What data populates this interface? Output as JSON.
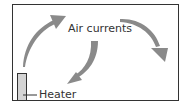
{
  "diagram": {
    "room_label": "Air currents",
    "heater_label": "Heater",
    "colors": {
      "frame": "#333333",
      "arrow": "#8a8a8a",
      "heater_fill": "#d4d4d4",
      "text": "#333333"
    }
  }
}
